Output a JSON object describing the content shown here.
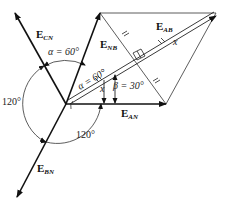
{
  "diagram": {
    "vectors": [
      {
        "id": "E_CN",
        "main": "E",
        "sub": "CN"
      },
      {
        "id": "E_NB",
        "main": "E",
        "sub": "NB"
      },
      {
        "id": "E_AB",
        "main": "E",
        "sub": "AB"
      },
      {
        "id": "E_AN",
        "main": "E",
        "sub": "AN"
      },
      {
        "id": "E_BN",
        "main": "E",
        "sub": "BN"
      }
    ],
    "angles": {
      "alpha_top": "α = 60°",
      "alpha_inner": "α = 60°",
      "beta": "β = 30°",
      "left": "120°",
      "bottom": "120°",
      "x_inner": "x",
      "x_right": "x"
    }
  }
}
